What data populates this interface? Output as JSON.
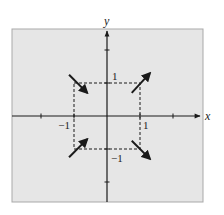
{
  "diagram": {
    "type": "vector-field-sketch",
    "axes": {
      "x_label": "x",
      "y_label": "y",
      "x_range": [
        -3,
        3
      ],
      "y_range": [
        -2.6,
        2.6
      ],
      "x_ticks": [
        -2,
        -1,
        1,
        2
      ],
      "y_ticks": [
        -2,
        -1,
        1,
        2
      ],
      "tick_labels": [
        {
          "axis": "x",
          "value": -1,
          "text": "−1"
        },
        {
          "axis": "x",
          "value": 1,
          "text": "1"
        },
        {
          "axis": "y",
          "value": 1,
          "text": "1"
        },
        {
          "axis": "y",
          "value": -1,
          "text": "−1"
        }
      ]
    },
    "dashed_square": {
      "x_min": -1,
      "x_max": 1,
      "y_min": -1,
      "y_max": 1
    },
    "arrows": [
      {
        "name": "arrow-upper-left",
        "from": [
          -1.15,
          1.25
        ],
        "to": [
          -0.6,
          0.7
        ]
      },
      {
        "name": "arrow-upper-right",
        "from": [
          0.75,
          0.7
        ],
        "to": [
          1.3,
          1.3
        ]
      },
      {
        "name": "arrow-lower-left",
        "from": [
          -1.15,
          -1.25
        ],
        "to": [
          -0.6,
          -0.7
        ]
      },
      {
        "name": "arrow-lower-right",
        "from": [
          0.75,
          -0.75
        ],
        "to": [
          1.3,
          -1.3
        ]
      }
    ],
    "colors": {
      "panel_fill": "#e6e6e6",
      "panel_border": "#a9a9a9",
      "ink": "#1a1a1a"
    }
  }
}
